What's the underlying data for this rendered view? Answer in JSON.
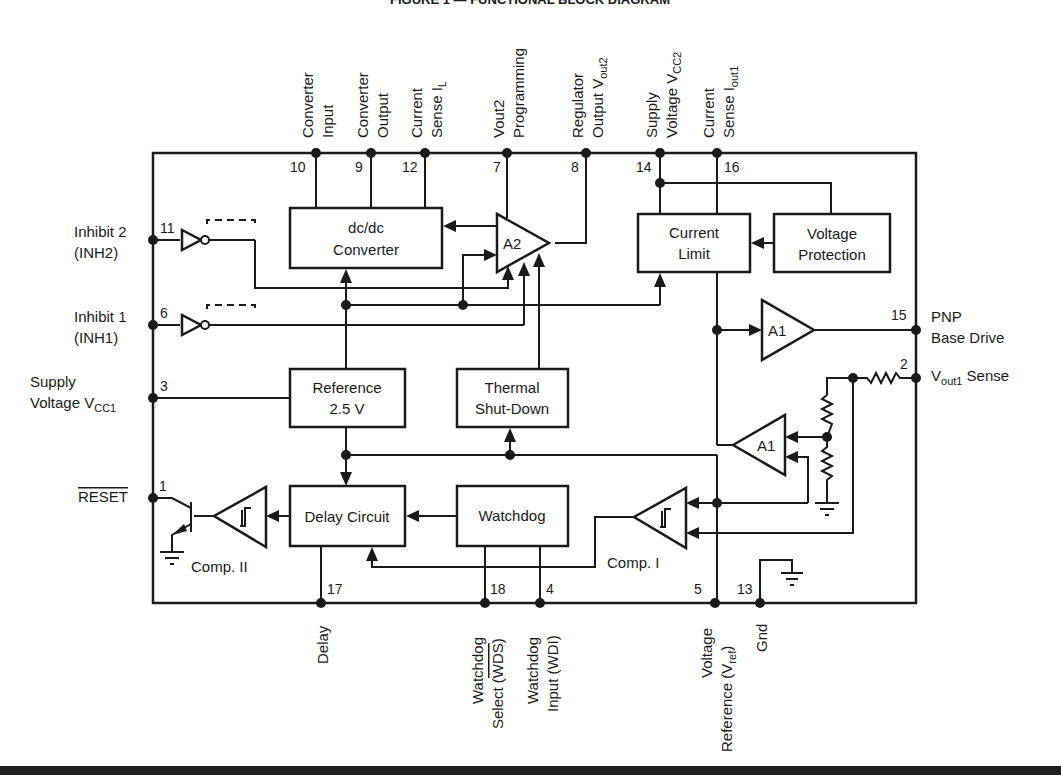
{
  "title": "FIGURE 1 — FUNCTIONAL BLOCK DIAGRAM",
  "colors": {
    "ink": "#1a1a1a",
    "background": "#ffffff"
  },
  "blocks": {
    "dcdc": {
      "line1": "dc/dc",
      "line2": "Converter"
    },
    "current_limit": {
      "line1": "Current",
      "line2": "Limit"
    },
    "voltage_protection": {
      "line1": "Voltage",
      "line2": "Protection"
    },
    "reference": {
      "line1": "Reference",
      "line2": "2.5 V"
    },
    "thermal": {
      "line1": "Thermal",
      "line2": "Shut-Down"
    },
    "delay": {
      "label": "Delay Circuit"
    },
    "watchdog": {
      "label": "Watchdog"
    },
    "a2": {
      "label": "A2"
    },
    "a1_top": {
      "label": "A1"
    },
    "a1_bottom": {
      "label": "A1"
    },
    "comp1": {
      "label": "Comp. I"
    },
    "comp2": {
      "label": "Comp. II"
    }
  },
  "pins": {
    "p10": {
      "num": "10",
      "line1": "Converter",
      "line2": "Input"
    },
    "p9": {
      "num": "9",
      "line1": "Converter",
      "line2": "Output"
    },
    "p12": {
      "num": "12",
      "line1": "Current",
      "line2": "Sense I",
      "sub": "L"
    },
    "p7": {
      "num": "7",
      "line1": "Vout2",
      "line2": "Programming"
    },
    "p8": {
      "num": "8",
      "line1": "Regulator",
      "line2": "Output V",
      "sub": "out2"
    },
    "p14": {
      "num": "14",
      "line1": "Supply",
      "line2": "Voltage V",
      "sub": "CC2"
    },
    "p16": {
      "num": "16",
      "line1": "Current",
      "line2": "Sense I",
      "sub": "out1"
    },
    "p11": {
      "num": "11",
      "line1": "Inhibit 2",
      "line2": "(INH2)"
    },
    "p6": {
      "num": "6",
      "line1": "Inhibit 1",
      "line2": "(INH1)"
    },
    "p3": {
      "num": "3",
      "line1": "Supply",
      "line2": "Voltage V",
      "sub": "CC1"
    },
    "p1": {
      "num": "1",
      "line1": "RESET"
    },
    "p15": {
      "num": "15",
      "line1": "PNP",
      "line2": "Base Drive"
    },
    "p2": {
      "num": "2",
      "line1": "V",
      "sub": "out1",
      "line2": " Sense"
    },
    "p17": {
      "num": "17",
      "line1": "Delay"
    },
    "p18": {
      "num": "18",
      "line1": "Watchdog",
      "line2": "Select (",
      "over": "WDS",
      "tail": ")"
    },
    "p4": {
      "num": "4",
      "line1": "Watchdog",
      "line2": "Input (WDI)"
    },
    "p5": {
      "num": "5",
      "line1": "Voltage",
      "line2": "Reference (V",
      "sub": "ref",
      "tail": ")"
    },
    "p13": {
      "num": "13",
      "line1": "Gnd"
    }
  }
}
